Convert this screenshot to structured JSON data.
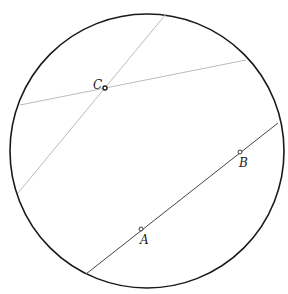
{
  "figure": {
    "circle": {
      "cx": 147,
      "cy": 151,
      "r": 137,
      "stroke": "#1a1a1a"
    },
    "lines": [
      {
        "id": "line-ab",
        "x1": 86,
        "y1": 274,
        "x2": 278,
        "y2": 123,
        "stroke": "#444444"
      },
      {
        "id": "line-c-diagonal",
        "x1": 18,
        "y1": 193,
        "x2": 166,
        "y2": 14,
        "stroke": "#bbbbbb"
      },
      {
        "id": "line-c-horizontal",
        "x1": 20,
        "y1": 105,
        "x2": 246,
        "y2": 60,
        "stroke": "#bbbbbb"
      }
    ],
    "points": [
      {
        "label": "A",
        "x": 141,
        "y": 229,
        "lx": 140,
        "ly": 243
      },
      {
        "label": "B",
        "x": 240,
        "y": 152,
        "lx": 239,
        "ly": 167
      },
      {
        "label": "C",
        "x": 105,
        "y": 88,
        "lx": 93,
        "ly": 88
      }
    ]
  },
  "labels": {
    "A": "A",
    "B": "B",
    "C": "C"
  }
}
